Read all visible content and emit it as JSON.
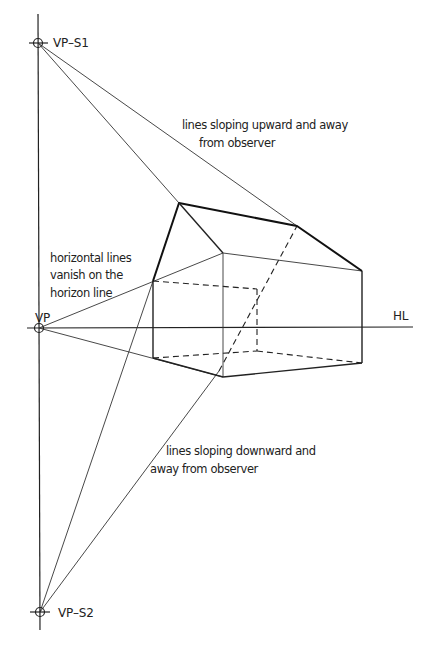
{
  "diagram": {
    "labels": {
      "vp_s1": "VP–S1",
      "vp_s2": "VP–S2",
      "vp": "VP",
      "hl": "HL",
      "upward_line1": "lines sloping upward and away",
      "upward_line2": "from observer",
      "horizontal_line1": "horizontal lines",
      "horizontal_line2": "vanish on the",
      "horizontal_line3": "horizon line",
      "downward_line1": "lines sloping downward and",
      "downward_line2": "away from observer"
    },
    "points": {
      "vp_s1": [
        38,
        43
      ],
      "vp": [
        39,
        328
      ],
      "vp_s2": [
        40,
        612
      ],
      "front_peak": [
        179,
        203
      ],
      "back_peak": [
        297,
        226
      ],
      "left_top": [
        153,
        281
      ],
      "left_bottom": [
        153,
        358
      ],
      "corner_top": [
        223,
        253
      ],
      "corner_bottom": [
        223,
        377
      ],
      "right_top": [
        362,
        271
      ],
      "right_bottom": [
        362,
        363
      ],
      "hidden_top": [
        257,
        289
      ],
      "hidden_bottom": [
        257,
        351
      ]
    },
    "horizon_y": 328
  }
}
